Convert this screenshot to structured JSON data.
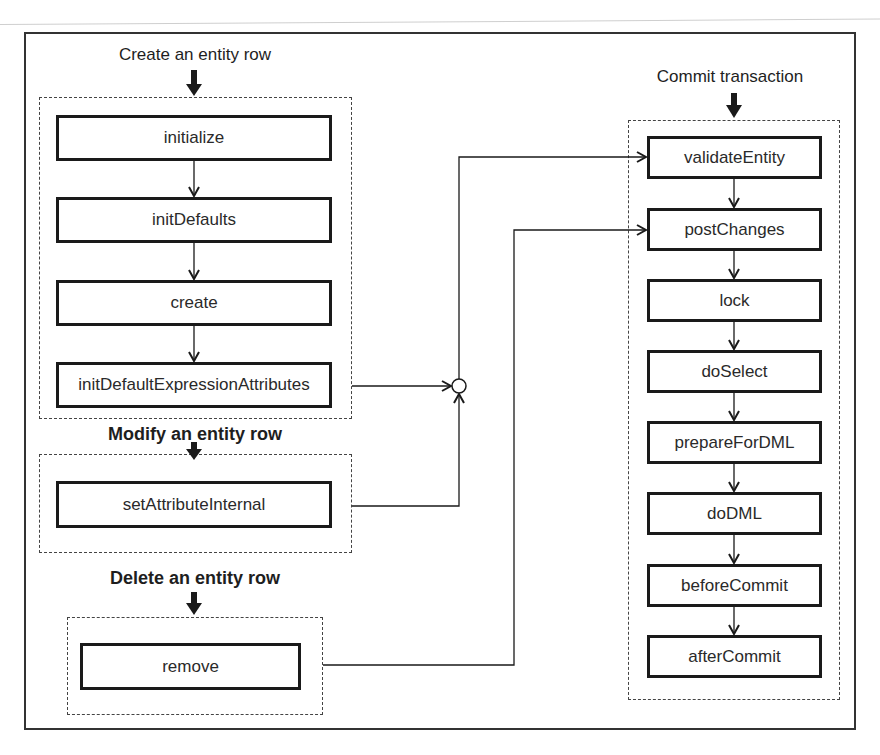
{
  "diagram": {
    "type": "flowchart",
    "groups": {
      "create": {
        "heading": "Create an entity row",
        "steps": [
          "initialize",
          "initDefaults",
          "create",
          "initDefaultExpressionAttributes"
        ]
      },
      "modify": {
        "heading": "Modify an entity row",
        "steps": [
          "setAttributeInternal"
        ]
      },
      "delete": {
        "heading": "Delete an entity row",
        "steps": [
          "remove"
        ]
      },
      "commit": {
        "heading": "Commit transaction",
        "steps": [
          "validateEntity",
          "postChanges",
          "lock",
          "doSelect",
          "prepareForDML",
          "doDML",
          "beforeCommit",
          "afterCommit"
        ]
      }
    },
    "connections": [
      {
        "from": "create",
        "to": "junction"
      },
      {
        "from": "modify",
        "to": "junction"
      },
      {
        "from": "junction",
        "to": "validateEntity"
      },
      {
        "from": "delete",
        "to": "postChanges"
      }
    ],
    "colors": {
      "stroke": "#1a1a1a",
      "dashed": "#444444",
      "background": "#ffffff"
    }
  }
}
